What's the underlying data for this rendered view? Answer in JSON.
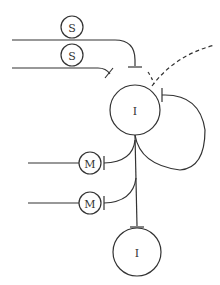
{
  "diagram": {
    "nodes": [
      {
        "id": "s1",
        "label": "S",
        "cx": 72,
        "cy": 27,
        "r": 11
      },
      {
        "id": "s2",
        "label": "S",
        "cx": 72,
        "cy": 55,
        "r": 11
      },
      {
        "id": "i1",
        "label": "I",
        "cx": 135,
        "cy": 110,
        "r": 25
      },
      {
        "id": "m1",
        "label": "M",
        "cx": 90,
        "cy": 163,
        "r": 11
      },
      {
        "id": "m2",
        "label": "M",
        "cx": 90,
        "cy": 203,
        "r": 11
      },
      {
        "id": "i2",
        "label": "I",
        "cx": 137,
        "cy": 252,
        "r": 24
      }
    ],
    "colors": {
      "stroke": "#333333",
      "background": "#ffffff"
    }
  }
}
